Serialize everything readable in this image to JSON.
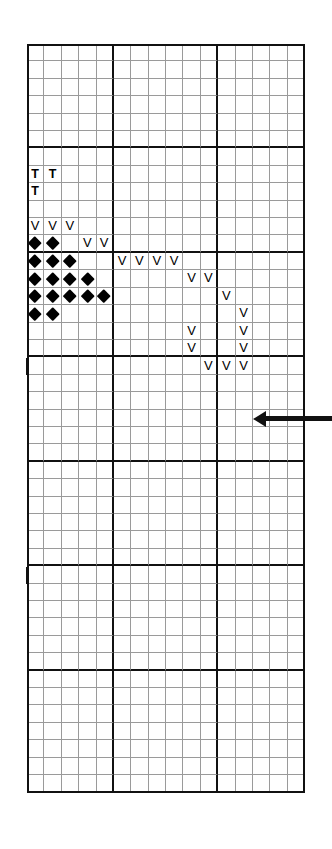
{
  "chart": {
    "type": "stitch-chart-grid",
    "columns": 16,
    "rows": 43,
    "cell_width": 17.38,
    "cell_height": 17.42,
    "origin_x": 27,
    "origin_y": 44,
    "grid_line_color": "#9a9a9a",
    "heavy_line_color": "#111111",
    "background_color": "#ffffff",
    "heavy_vertical_after_columns": [
      5,
      11
    ],
    "heavy_horizontal_after_rows": [
      6,
      12,
      18,
      24,
      30,
      36
    ],
    "legend": {
      "t_symbol": "T",
      "v_symbol": "V",
      "diamond_symbol": "diamond"
    },
    "symbols": [
      {
        "row": 8,
        "col": 1,
        "type": "T"
      },
      {
        "row": 8,
        "col": 2,
        "type": "T"
      },
      {
        "row": 9,
        "col": 1,
        "type": "T"
      },
      {
        "row": 11,
        "col": 1,
        "type": "V"
      },
      {
        "row": 11,
        "col": 2,
        "type": "V"
      },
      {
        "row": 11,
        "col": 3,
        "type": "V"
      },
      {
        "row": 12,
        "col": 1,
        "type": "D"
      },
      {
        "row": 12,
        "col": 2,
        "type": "D"
      },
      {
        "row": 12,
        "col": 4,
        "type": "V"
      },
      {
        "row": 12,
        "col": 5,
        "type": "V"
      },
      {
        "row": 13,
        "col": 1,
        "type": "D"
      },
      {
        "row": 13,
        "col": 2,
        "type": "D"
      },
      {
        "row": 13,
        "col": 3,
        "type": "D"
      },
      {
        "row": 13,
        "col": 6,
        "type": "V"
      },
      {
        "row": 13,
        "col": 7,
        "type": "V"
      },
      {
        "row": 13,
        "col": 8,
        "type": "V"
      },
      {
        "row": 13,
        "col": 9,
        "type": "V"
      },
      {
        "row": 14,
        "col": 1,
        "type": "D"
      },
      {
        "row": 14,
        "col": 2,
        "type": "D"
      },
      {
        "row": 14,
        "col": 3,
        "type": "D"
      },
      {
        "row": 14,
        "col": 4,
        "type": "D"
      },
      {
        "row": 14,
        "col": 10,
        "type": "V"
      },
      {
        "row": 14,
        "col": 11,
        "type": "V"
      },
      {
        "row": 15,
        "col": 1,
        "type": "D"
      },
      {
        "row": 15,
        "col": 2,
        "type": "D"
      },
      {
        "row": 15,
        "col": 3,
        "type": "D"
      },
      {
        "row": 15,
        "col": 4,
        "type": "D"
      },
      {
        "row": 15,
        "col": 5,
        "type": "D"
      },
      {
        "row": 15,
        "col": 12,
        "type": "V"
      },
      {
        "row": 16,
        "col": 1,
        "type": "D"
      },
      {
        "row": 16,
        "col": 2,
        "type": "D"
      },
      {
        "row": 16,
        "col": 13,
        "type": "V"
      },
      {
        "row": 17,
        "col": 10,
        "type": "V"
      },
      {
        "row": 17,
        "col": 13,
        "type": "V"
      },
      {
        "row": 18,
        "col": 10,
        "type": "V"
      },
      {
        "row": 18,
        "col": 13,
        "type": "V"
      },
      {
        "row": 19,
        "col": 11,
        "type": "V"
      },
      {
        "row": 19,
        "col": 12,
        "type": "V"
      },
      {
        "row": 19,
        "col": 13,
        "type": "V"
      }
    ],
    "edge_ticks": [
      {
        "row": 19,
        "height_rows": 1
      },
      {
        "row": 31,
        "height_rows": 1
      }
    ],
    "row_arrow": {
      "direction": "left",
      "row": 22,
      "label": "row-direction-arrow"
    }
  }
}
